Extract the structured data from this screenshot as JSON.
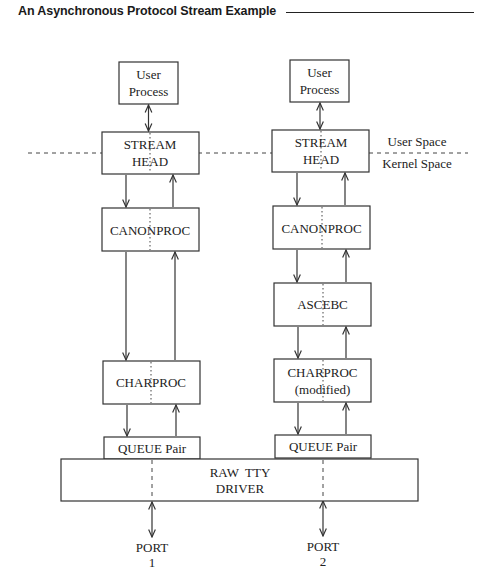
{
  "header": {
    "title": "An Asynchronous Protocol Stream Example"
  },
  "space_labels": {
    "user": "User Space",
    "kernel": "Kernel Space"
  },
  "stream1": {
    "user_process": [
      "User",
      "Process"
    ],
    "stream_head": [
      "STREAM",
      "HEAD"
    ],
    "canonproc": "CANONPROC",
    "charproc": "CHARPROC",
    "queue_pair": "QUEUE Pair",
    "port": [
      "PORT",
      "1"
    ]
  },
  "stream2": {
    "user_process": [
      "User",
      "Process"
    ],
    "stream_head": [
      "STREAM",
      "HEAD"
    ],
    "canonproc": "CANONPROC",
    "ascebc": "ASCEBC",
    "charproc": [
      "CHARPROC",
      "(modified)"
    ],
    "queue_pair": "QUEUE Pair",
    "port": [
      "PORT",
      "2"
    ]
  },
  "driver": {
    "label": [
      "RAW  TTY",
      "DRIVER"
    ]
  }
}
